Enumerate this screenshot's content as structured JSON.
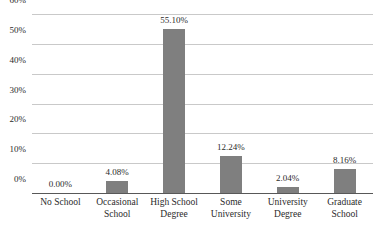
{
  "chart_data": {
    "type": "bar",
    "title": "",
    "subtitle": "",
    "xlabel": "",
    "ylabel": "",
    "categories": [
      "No School",
      "Occasional School",
      "High School Degree",
      "Some University",
      "University Degree",
      "Graduate School"
    ],
    "category_lines": [
      [
        "No School"
      ],
      [
        "Occasional",
        "School"
      ],
      [
        "High School",
        "Degree"
      ],
      [
        "Some",
        "University"
      ],
      [
        "University",
        "Degree"
      ],
      [
        "Graduate",
        "School"
      ]
    ],
    "values": [
      0.0,
      4.08,
      55.1,
      12.24,
      2.04,
      8.16
    ],
    "data_labels": [
      "0.00%",
      "4.08%",
      "55.10%",
      "12.24%",
      "2.04%",
      "8.16%"
    ],
    "ylim": [
      0,
      60
    ],
    "yticks": [
      0,
      10,
      20,
      30,
      40,
      50,
      60
    ],
    "ytick_labels": [
      "0%",
      "10%",
      "20%",
      "30%",
      "40%",
      "50%",
      "60%"
    ],
    "grid": true,
    "legend": false,
    "legend_position": "none",
    "bar_color": "#7f7f7f",
    "gridline_color": "#c9c9c9",
    "axis_color": "#585858",
    "text_color": "#2b2b2b",
    "background_color": "#ffffff"
  }
}
